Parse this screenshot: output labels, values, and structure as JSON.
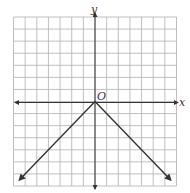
{
  "chart_data": {
    "type": "line",
    "title": "",
    "xlabel": "x",
    "ylabel": "y",
    "origin_label": "O",
    "xlim": [
      -7,
      7
    ],
    "ylim": [
      -7,
      7
    ],
    "grid": true,
    "grid_step": 1,
    "axes_arrows": true,
    "function": "y = -|x|",
    "series": [
      {
        "name": "y = -|x|",
        "points": [
          [
            -6.5,
            -6.5
          ],
          [
            0,
            0
          ],
          [
            6.5,
            -6.5
          ]
        ],
        "arrows_on_ends": true,
        "color": "#333333"
      }
    ]
  },
  "colors": {
    "grid": "#b0b0b0",
    "axes": "#333333",
    "line": "#333333"
  }
}
